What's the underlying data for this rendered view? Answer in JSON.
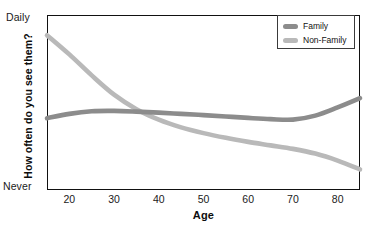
{
  "chart_data": {
    "type": "line",
    "title": "",
    "xlabel": "Age",
    "ylabel": "How often do you see them?",
    "xlim": [
      15,
      85
    ],
    "ylim": [
      0,
      1
    ],
    "grid": false,
    "legend_position": "top-right",
    "x_ticks": [
      "20",
      "30",
      "40",
      "50",
      "60",
      "70",
      "80"
    ],
    "x_tick_values": [
      20,
      30,
      40,
      50,
      60,
      70,
      80
    ],
    "y_tick_labels": [
      "Never",
      "Daily"
    ],
    "y_tick_values": [
      0,
      1
    ],
    "y_axis_top_label": "Daily",
    "y_axis_bottom_label": "Never",
    "x": [
      15,
      20,
      25,
      30,
      35,
      40,
      45,
      50,
      55,
      60,
      65,
      70,
      75,
      80,
      85
    ],
    "series": [
      {
        "name": "Family",
        "color": "#8c8c8c",
        "values": [
          0.41,
          0.435,
          0.45,
          0.452,
          0.448,
          0.442,
          0.435,
          0.428,
          0.42,
          0.412,
          0.405,
          0.402,
          0.425,
          0.472,
          0.525
        ]
      },
      {
        "name": "Non-Family",
        "color": "#b9b9b9",
        "values": [
          0.885,
          0.775,
          0.655,
          0.545,
          0.462,
          0.402,
          0.358,
          0.325,
          0.298,
          0.275,
          0.255,
          0.235,
          0.208,
          0.168,
          0.118
        ]
      }
    ],
    "annotations": []
  },
  "legend": {
    "entries": [
      {
        "label": "Family",
        "swatch_name": "legend-swatch-family"
      },
      {
        "label": "Non-Family",
        "swatch_name": "legend-swatch-non-family"
      }
    ]
  },
  "colors": {
    "family": "#8c8c8c",
    "non_family": "#b9b9b9",
    "frame": "#111111",
    "background": "#ffffff",
    "text": "#111111"
  }
}
